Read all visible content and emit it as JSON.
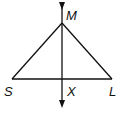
{
  "diagram": {
    "type": "geometry-figure",
    "points": {
      "M": {
        "label": "M",
        "x": 62,
        "y": 23
      },
      "S": {
        "label": "S",
        "x": 12,
        "y": 79
      },
      "L": {
        "label": "L",
        "x": 112,
        "y": 79
      },
      "X": {
        "label": "X",
        "x": 62,
        "y": 79
      }
    },
    "segments": [
      {
        "from": "S",
        "to": "M"
      },
      {
        "from": "M",
        "to": "L"
      },
      {
        "from": "S",
        "to": "L"
      }
    ],
    "line": {
      "through": [
        "M",
        "X"
      ],
      "arrows": "both"
    },
    "labels": {
      "M": "M",
      "S": "S",
      "X": "X",
      "L": "L"
    },
    "colors": {
      "stroke": "#111111",
      "background": "#ffffff"
    }
  }
}
